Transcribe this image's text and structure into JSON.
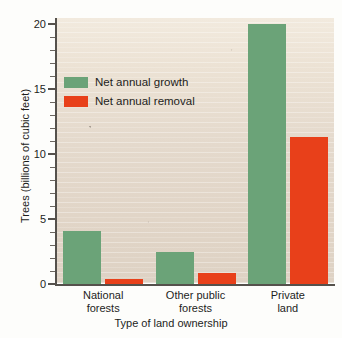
{
  "chart_data": {
    "type": "bar",
    "title": "",
    "xlabel": "Type of land ownership",
    "ylabel": "Trees (billions of cubic feet)",
    "categories": [
      "National forests",
      "Other public forests",
      "Private land"
    ],
    "category_lines": [
      [
        "National",
        "forests"
      ],
      [
        "Other public",
        "forests"
      ],
      [
        "Private",
        "land"
      ]
    ],
    "series": [
      {
        "name": "Net annual growth",
        "color": "#6ba378",
        "values": [
          4.1,
          2.5,
          20.0
        ]
      },
      {
        "name": "Net annual removal",
        "color": "#e8401a",
        "values": [
          0.4,
          0.85,
          11.35
        ]
      }
    ],
    "ylim": [
      0,
      20.5
    ],
    "yticks": [
      0,
      5,
      10,
      15,
      20
    ],
    "ytick_labels": [
      "0",
      "5",
      "10",
      "15",
      "20"
    ],
    "yminor_step": 1,
    "grid": false,
    "legend_position": "upper left",
    "plot_background": "#e4d9cc",
    "axis_color": "#55514c"
  },
  "legend": {
    "items": [
      {
        "label": "Net annual growth",
        "color": "#6ba378"
      },
      {
        "label": "Net annual removal",
        "color": "#e8401a"
      }
    ]
  },
  "axes": {
    "y_title": "Trees (billions of cubic feet)",
    "x_title": "Type of land ownership",
    "y_labels": [
      "0",
      "5",
      "10",
      "15",
      "20"
    ]
  }
}
